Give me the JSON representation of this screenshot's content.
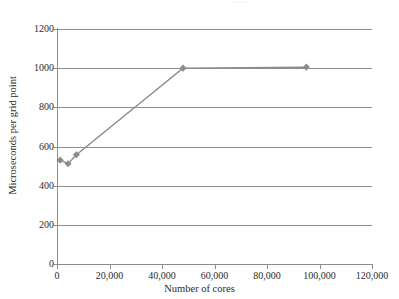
{
  "caption": {
    "clipped_text": "......."
  },
  "chart_data": {
    "type": "line",
    "title": "",
    "xlabel": "Number of cores",
    "ylabel": "Microseconds per grid point",
    "xlim": [
      0,
      120000
    ],
    "ylim": [
      0,
      1200
    ],
    "xticks": [
      0,
      20000,
      40000,
      60000,
      80000,
      100000,
      120000
    ],
    "xticklabels": [
      "0",
      "20,000",
      "40,000",
      "60,000",
      "80,000",
      "100,000",
      "120,000"
    ],
    "yticks": [
      0,
      200,
      400,
      600,
      800,
      1000,
      1200
    ],
    "yticklabels": [
      "0",
      "200",
      "400",
      "600",
      "800",
      "1000",
      "1200"
    ],
    "grid": "horizontal",
    "legend": "none",
    "marker": "diamond",
    "series_color": "#8c8c8c",
    "grid_color": "#8e8e8e",
    "axis_color": "#8d8d8d",
    "series": [
      {
        "name": "Microseconds per grid point",
        "x": [
          1200,
          4200,
          7400,
          48000,
          95000
        ],
        "y": [
          530,
          512,
          558,
          1000,
          1005
        ]
      }
    ]
  }
}
